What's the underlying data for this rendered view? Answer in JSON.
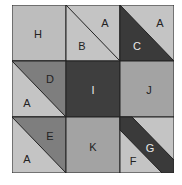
{
  "diagram": {
    "colors": {
      "light": "#c2c2c2",
      "medium": "#a6a6a6",
      "medium_dark": "#7c7c7c",
      "dark": "#3c3c3c",
      "outline": "#222222",
      "label_dark": "#222222",
      "label_light": "#e8e8e8"
    },
    "cells": [
      {
        "row": 0,
        "col": 0,
        "type": "square",
        "labels": [
          "H"
        ]
      },
      {
        "row": 0,
        "col": 1,
        "type": "half-square",
        "labels": [
          "A",
          "B"
        ]
      },
      {
        "row": 0,
        "col": 2,
        "type": "half-square",
        "labels": [
          "A",
          "C"
        ]
      },
      {
        "row": 1,
        "col": 0,
        "type": "half-square",
        "labels": [
          "D",
          "A"
        ]
      },
      {
        "row": 1,
        "col": 1,
        "type": "square",
        "labels": [
          "I"
        ]
      },
      {
        "row": 1,
        "col": 2,
        "type": "square",
        "labels": [
          "J"
        ]
      },
      {
        "row": 2,
        "col": 0,
        "type": "half-square",
        "labels": [
          "E",
          "A"
        ]
      },
      {
        "row": 2,
        "col": 1,
        "type": "square",
        "labels": [
          "K"
        ]
      },
      {
        "row": 2,
        "col": 2,
        "type": "strip",
        "labels": [
          "G",
          "F"
        ]
      }
    ],
    "labels": {
      "H": "H",
      "A1": "A",
      "B": "B",
      "A2": "A",
      "C": "C",
      "D": "D",
      "A3": "A",
      "I": "I",
      "J": "J",
      "E": "E",
      "A4": "A",
      "K": "K",
      "G": "G",
      "F": "F"
    }
  }
}
